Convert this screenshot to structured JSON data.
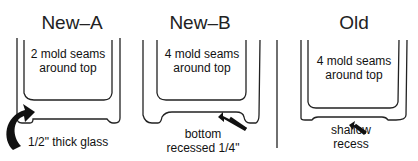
{
  "panels": [
    {
      "title": "New–A",
      "seams_line1": "2 mold seams",
      "seams_line2": "around top",
      "note": "1/2\" thick glass"
    },
    {
      "title": "New–B",
      "seams_line1": "4 mold seams",
      "seams_line2": "around top",
      "note_line1": "bottom",
      "note_line2": "recessed 1/4\""
    },
    {
      "title": "Old",
      "seams_line1": "4 mold seams",
      "seams_line2": "around top",
      "note_line1": "shallow",
      "note_line2": "recess"
    }
  ],
  "colors": {
    "line": "#222222",
    "background": "#ffffff"
  }
}
